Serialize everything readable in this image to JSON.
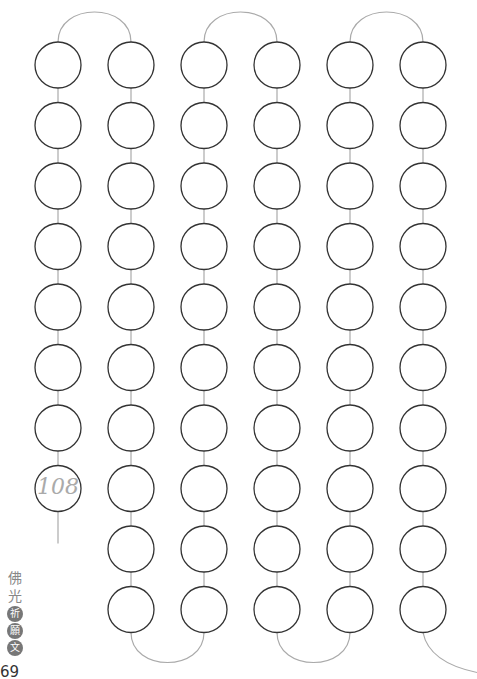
{
  "sheet": {
    "title_chars": [
      "佛",
      "光",
      "祈",
      "願",
      "文"
    ],
    "title_dark_from_index": 2,
    "page_number": "69",
    "count_label": "108"
  },
  "layout": {
    "columns_x": [
      58,
      131,
      204,
      277,
      350,
      423
    ],
    "row_y_start": 65,
    "row_pitch": 60.5,
    "radius": 23,
    "column_bead_counts": [
      8,
      10,
      10,
      10,
      10,
      10
    ],
    "stroke_color": "#333333",
    "string_color": "#aaaaaa"
  }
}
